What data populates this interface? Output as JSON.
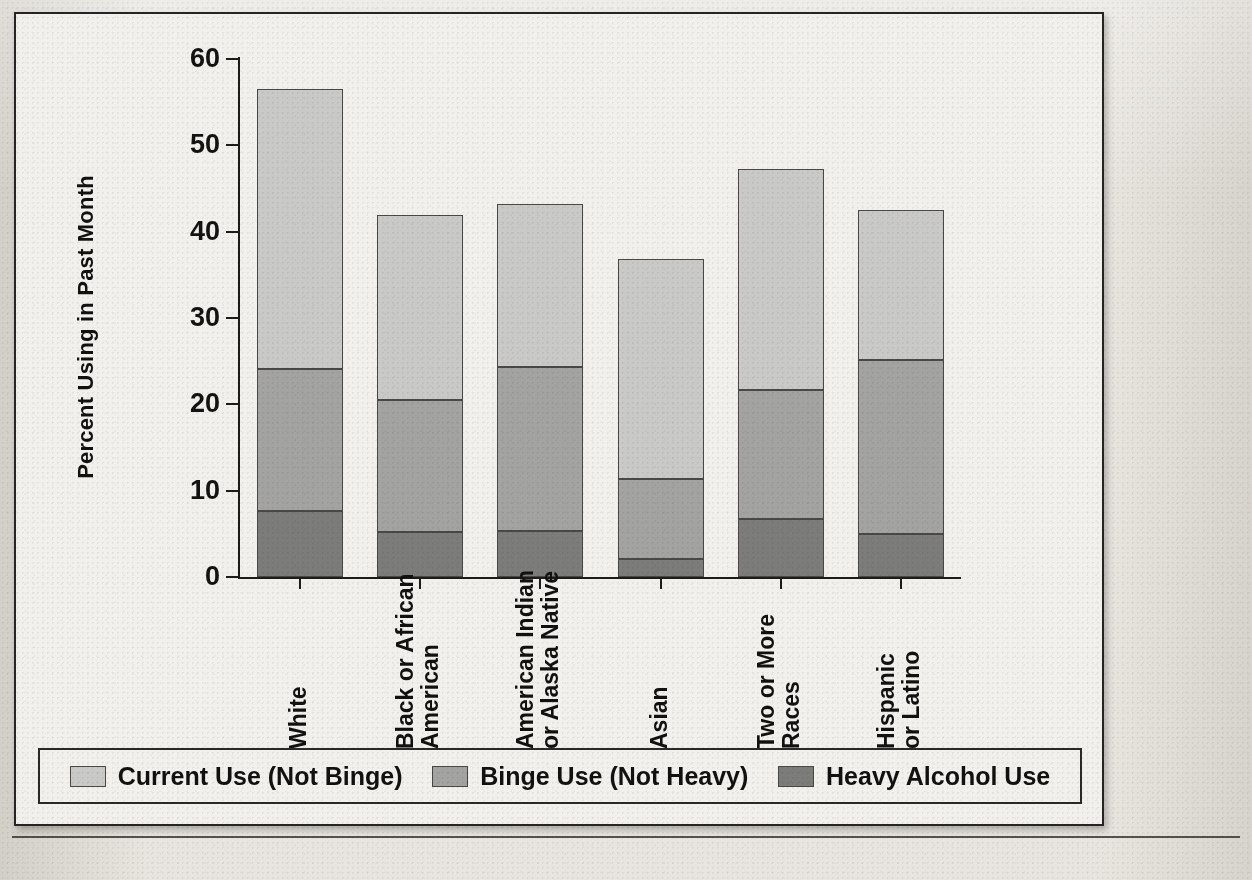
{
  "chart_data": {
    "type": "bar",
    "subtype": "stacked-bar",
    "title": "",
    "xlabel": "",
    "ylabel": "Percent Using in Past Month",
    "ylim": [
      0,
      60
    ],
    "yticks": [
      0,
      10,
      20,
      30,
      40,
      50,
      60
    ],
    "ytick_labels": [
      "0",
      "10",
      "20",
      "30",
      "40",
      "50",
      "60"
    ],
    "grid": false,
    "legend_position": "bottom",
    "categories": [
      "White",
      "Black or African American",
      "American Indian or Alaska Native",
      "Asian",
      "Two or More Races",
      "Hispanic or Latino"
    ],
    "category_lines": [
      [
        "White"
      ],
      [
        "Black or African",
        "American"
      ],
      [
        "American Indian",
        "or Alaska Native"
      ],
      [
        "Asian"
      ],
      [
        "Two or More",
        "Races"
      ],
      [
        "Hispanic",
        "or Latino"
      ]
    ],
    "series": [
      {
        "name": "Heavy Alcohol Use",
        "color": "#7c7c7a",
        "values": [
          7.6,
          5.2,
          5.3,
          2.1,
          6.7,
          5.0
        ]
      },
      {
        "name": "Binge Use (Not Heavy)",
        "color": "#a3a3a1",
        "values": [
          16.5,
          15.3,
          19.0,
          9.3,
          15.0,
          20.1
        ]
      },
      {
        "name": "Current Use (Not Binge)",
        "color": "#c9c9c7",
        "values": [
          32.4,
          21.4,
          18.9,
          25.4,
          25.6,
          17.4
        ]
      }
    ],
    "cumulative_tops": [
      [
        7.6,
        24.1,
        56.5
      ],
      [
        5.2,
        20.5,
        41.9
      ],
      [
        5.3,
        24.3,
        43.2
      ],
      [
        2.1,
        11.4,
        36.8
      ],
      [
        6.7,
        21.7,
        47.3
      ],
      [
        5.0,
        25.1,
        42.5
      ]
    ],
    "totals": [
      56.5,
      41.9,
      43.2,
      36.8,
      47.3,
      42.5
    ]
  },
  "legend": {
    "items": [
      {
        "label": "Current Use (Not Binge)",
        "swatch": "current"
      },
      {
        "label": "Binge Use (Not Heavy)",
        "swatch": "binge"
      },
      {
        "label": "Heavy Alcohol Use",
        "swatch": "heavy"
      }
    ]
  },
  "background_text": {
    "top_left": "",
    "paragraph_1": "",
    "paragraph_2": "",
    "bottom": ""
  }
}
